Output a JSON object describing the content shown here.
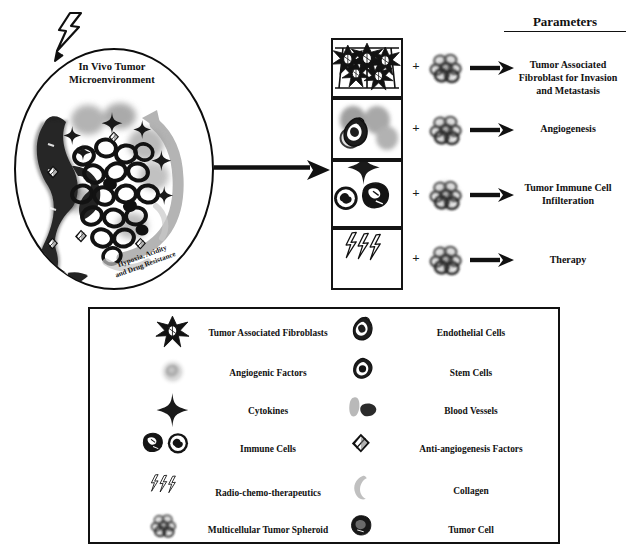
{
  "figure": {
    "background_color": "#ffffff",
    "ink_color": "#111111"
  },
  "invivo": {
    "title": "In Vivo Tumor\nMicroenvironment",
    "title_line1": "In Vivo Tumor",
    "title_line2": "Microenvironment",
    "curved_label_line1": "Hypoxia, Acidity",
    "curved_label_line2": "and Drug Resistance",
    "icon_top": "lightning-bolt-icon",
    "shape": "ellipse"
  },
  "main_arrow": {
    "icon": "right-arrow-icon",
    "direction": "right"
  },
  "parameters": {
    "heading": "Parameters",
    "plus_symbol": "+",
    "arrow_icon": "right-arrow-icon",
    "spheroid_icon": "multicellular-tumor-spheroid-icon",
    "rows": [
      {
        "panel_icon": "tumor-associated-fibroblasts-icon",
        "label": "Tumor Associated Fibroblast for Invasion and Metastasis",
        "label_lines": [
          "Tumor Associated",
          "Fibroblast for Invasion",
          "and Metastasis"
        ]
      },
      {
        "panel_icon": "blood-vessels-endothelial-cells-icon",
        "label": "Angiogenesis",
        "label_lines": [
          "Angiogenesis"
        ]
      },
      {
        "panel_icon": "immune-cells-cytokine-icon",
        "label": "Tumor Immune Cell Infilteration",
        "label_lines": [
          "Tumor Immune Cell",
          "Infilteration"
        ]
      },
      {
        "panel_icon": "radio-chemo-therapeutics-icon",
        "label": "Therapy",
        "label_lines": [
          "Therapy"
        ]
      }
    ]
  },
  "legend": {
    "left_column": [
      {
        "icon": "tumor-associated-fibroblasts-icon",
        "label": "Tumor Associated Fibroblasts"
      },
      {
        "icon": "angiogenic-factors-icon",
        "label": "Angiogenic Factors"
      },
      {
        "icon": "cytokines-icon",
        "label": "Cytokines"
      },
      {
        "icon": "immune-cells-icon",
        "label": "Immune Cells"
      },
      {
        "icon": "radio-chemo-therapeutics-icon",
        "label": "Radio-chemo-therapeutics"
      },
      {
        "icon": "multicellular-tumor-spheroid-icon",
        "label": "Multicellular Tumor Spheroid"
      }
    ],
    "right_column": [
      {
        "icon": "endothelial-cells-icon",
        "label": "Endothelial Cells"
      },
      {
        "icon": "stem-cells-icon",
        "label": "Stem Cells"
      },
      {
        "icon": "blood-vessels-icon",
        "label": "Blood Vessels"
      },
      {
        "icon": "anti-angiogenesis-factors-icon",
        "label": "Anti-angiogenesis Factors"
      },
      {
        "icon": "collagen-icon",
        "label": "Collagen"
      },
      {
        "icon": "tumor-cell-icon",
        "label": "Tumor Cell"
      }
    ]
  }
}
